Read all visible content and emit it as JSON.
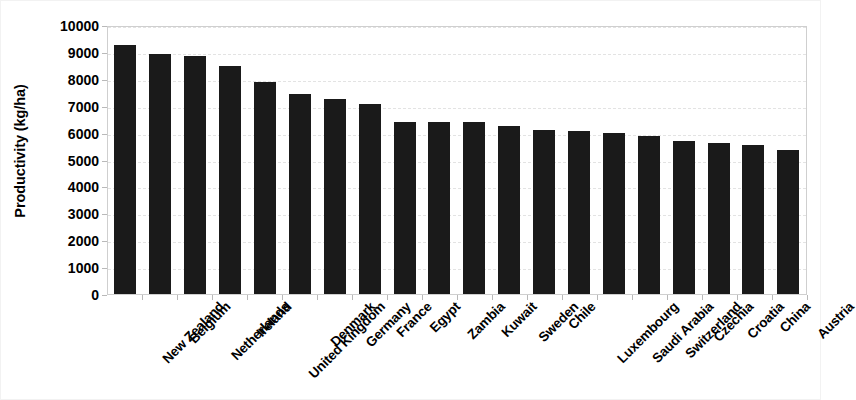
{
  "chart_data": {
    "type": "bar",
    "title": "",
    "xlabel": "",
    "ylabel": "Productivity (kg/ha)",
    "ylim": [
      0,
      10000
    ],
    "ytick_step": 1000,
    "yticks": [
      "10000",
      "9000",
      "8000",
      "7000",
      "6000",
      "5000",
      "4000",
      "3000",
      "2000",
      "1000",
      "0"
    ],
    "grid": "horizontal-dashed-light",
    "legend": "none",
    "bar_color": "#1a1a1a",
    "categories": [
      "New Zealand",
      "Belgium",
      "Netherlands",
      "Ireland",
      "United Kingdom",
      "Denmark",
      "Germany",
      "France",
      "Egypt",
      "Zambia",
      "Kuwait",
      "Sweden",
      "Chile",
      "Luxembourg",
      "Saudi Arabia",
      "Switzerland",
      "Czechia",
      "Croatia",
      "China",
      "Austria"
    ],
    "values": [
      9250,
      8930,
      8850,
      8480,
      7870,
      7450,
      7260,
      7060,
      6400,
      6390,
      6380,
      6230,
      6100,
      6050,
      5990,
      5880,
      5680,
      5600,
      5540,
      5370
    ]
  }
}
